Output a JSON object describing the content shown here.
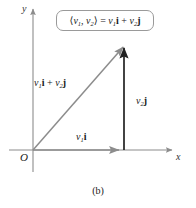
{
  "figure": {
    "caption": "(b)",
    "axes": {
      "y_label": "y",
      "x_label": "x",
      "origin_label": "O",
      "axis_color": "#8c8c8c"
    },
    "equation_box": {
      "lead_bracket": "⟨",
      "v1": "v",
      "v1_sub": "1",
      "comma": ", ",
      "v2": "v",
      "v2_sub": "2",
      "close_bracket": "⟩",
      "equals": " = ",
      "term1_scalar": "v",
      "term1_sub": "1",
      "term1_unit": "i",
      "plus": " + ",
      "term2_scalar": "v",
      "term2_sub": "2",
      "term2_unit": "j",
      "border_color": "#9a9a9a"
    },
    "vectors": [
      {
        "name": "resultant",
        "label_scalar1": "v",
        "label_sub1": "1",
        "label_unit1": "i",
        "label_plus": " + ",
        "label_scalar2": "v",
        "label_sub2": "2",
        "label_unit2": "j",
        "color": "#8c8c8c",
        "from": [
          33,
          150
        ],
        "to": [
          124,
          45
        ]
      },
      {
        "name": "vertical-component",
        "label_scalar": "v",
        "label_sub": "2",
        "label_unit": "j",
        "color": "#1a1a1a",
        "from": [
          124,
          150
        ],
        "to": [
          124,
          45
        ]
      },
      {
        "name": "horizontal-component",
        "label_scalar": "v",
        "label_sub": "1",
        "label_unit": "i",
        "color": "#8c8c8c",
        "from": [
          33,
          150
        ],
        "to": [
          123,
          150
        ]
      }
    ]
  }
}
